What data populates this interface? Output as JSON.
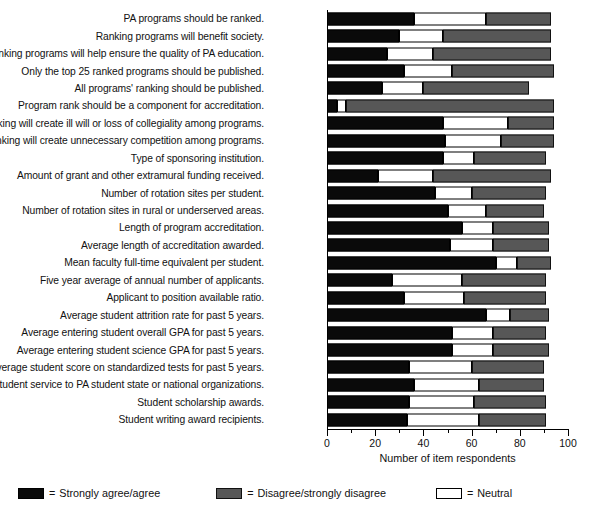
{
  "chart_data": {
    "type": "bar",
    "orientation": "horizontal",
    "stacked": true,
    "title": "",
    "xlabel": "Number of item respondents",
    "ylabel": "",
    "xlim": [
      0,
      100
    ],
    "xticks": [
      0,
      20,
      40,
      60,
      80,
      100
    ],
    "xtick_labels": [
      "0",
      "20",
      "40",
      "60",
      "80",
      "100"
    ],
    "minor_xticks": [
      10,
      30,
      50,
      70,
      90
    ],
    "grid": false,
    "legend_position": "below",
    "colors": {
      "agree": "#0a0a0a",
      "neutral": "#ffffff",
      "disagree": "#575757"
    },
    "series": [
      {
        "name": "Strongly agree/agree",
        "key": "agree",
        "values": [
          36,
          30,
          25,
          32,
          23,
          4,
          48,
          49,
          48,
          21,
          45,
          50,
          56,
          51,
          70,
          27,
          32,
          66,
          52,
          52,
          34,
          36,
          34,
          33
        ]
      },
      {
        "name": "Neutral",
        "key": "neutral",
        "values": [
          30,
          18,
          19,
          20,
          17,
          4,
          27,
          23,
          13,
          23,
          15,
          16,
          13,
          18,
          9,
          29,
          25,
          10,
          17,
          17,
          26,
          27,
          27,
          30
        ]
      },
      {
        "name": "Disagree/strongly disagree",
        "key": "disagree",
        "values": [
          27,
          45,
          49,
          42,
          44,
          86,
          19,
          22,
          30,
          49,
          31,
          24,
          23,
          23,
          14,
          35,
          34,
          16,
          22,
          23,
          30,
          27,
          30,
          28
        ]
      }
    ],
    "categories": [
      "PA programs should be ranked.",
      "Ranking programs will benefit society.",
      "Ranking programs will help ensure the quality of PA education.",
      "Only the top 25 ranked programs should be published.",
      "All programs' ranking should be published.",
      "Program rank should be a component for accreditation.",
      "Ranking will create ill will or loss of collegiality among programs.",
      "Ranking will create unnecessary competition among programs.",
      "Type of sponsoring institution.",
      "Amount of grant and other extramural funding received.",
      "Number of rotation sites per student.",
      "Number of rotation sites in rural or underserved areas.",
      "Length of program accreditation.",
      "Average length of accreditation awarded.",
      "Mean faculty full-time equivalent per student.",
      "Five year average of annual number of applicants.",
      "Applicant to position available ratio.",
      "Average student attrition rate for past 5 years.",
      "Average entering student overall GPA for past 5 years.",
      "Average entering student science GPA for past 5 years.",
      "Average student score on standardized tests for past 5 years.",
      "Student service to PA student state or national organizations.",
      "Student scholarship awards.",
      "Student writing award recipients."
    ]
  },
  "legend": {
    "items": [
      {
        "key": "agree",
        "equals": "=",
        "label": "Strongly agree/agree"
      },
      {
        "key": "disagree",
        "equals": "=",
        "label": "Disagree/strongly disagree"
      },
      {
        "key": "neutral",
        "equals": "=",
        "label": "Neutral"
      }
    ]
  },
  "axis": {
    "title": "Number of item respondents"
  }
}
